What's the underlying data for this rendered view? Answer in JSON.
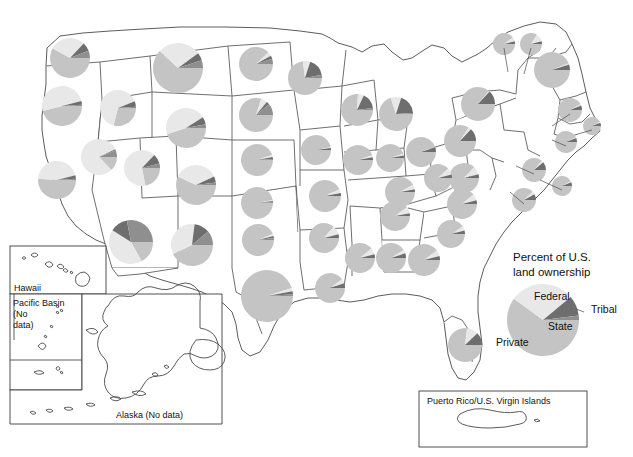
{
  "figure": {
    "title": "Percent of U.S. land ownership",
    "kind": "choropleth-pie-map"
  },
  "legend": {
    "title_line1": "Percent of U.S.",
    "title_line2": "land ownership",
    "center": {
      "x": 543,
      "y": 320
    },
    "radius": 36,
    "labels": {
      "federal": "Federal",
      "tribal": "Tribal",
      "state": "State",
      "private": "Private"
    }
  },
  "colors": {
    "private": "#c4c4c4",
    "federal": "#e8e8e8",
    "state": "#6e6e6e",
    "tribal": "#8f8f8f",
    "outline": "#4a4a4a",
    "background": "#ffffff",
    "text": "#111111"
  },
  "categories": [
    "private",
    "federal",
    "state",
    "tribal"
  ],
  "insets": [
    {
      "name": "hawaii",
      "label": "Hawaii",
      "no_data": false,
      "box": {
        "x": 10,
        "y": 246,
        "w": 96,
        "h": 48
      }
    },
    {
      "name": "pacific-basin",
      "label": "Pacific Basin (No data)",
      "no_data": true,
      "label_lines": [
        "Pacific Basin",
        "(No",
        "data)"
      ],
      "box": {
        "x": 10,
        "y": 294,
        "w": 72,
        "h": 96
      }
    },
    {
      "name": "alaska",
      "label": "Alaska (No data)",
      "no_data": true,
      "box": {
        "x": 10,
        "y": 294,
        "w": 212,
        "h": 130
      }
    },
    {
      "name": "puerto-rico",
      "label": "Puerto Rico/U.S. Virgin Islands",
      "no_data": false,
      "box": {
        "x": 419,
        "y": 391,
        "w": 168,
        "h": 56
      }
    }
  ],
  "chart_data": {
    "type": "pie",
    "title": "Percent of U.S. land ownership",
    "series_names": [
      "Private",
      "Federal",
      "State",
      "Tribal"
    ],
    "legend_position": "right",
    "national": {
      "private": 60,
      "federal": 29,
      "state": 9,
      "tribal": 2
    },
    "units": "percent",
    "states": [
      {
        "code": "WA",
        "name": "Washington",
        "cx": 70,
        "cy": 58,
        "r": 20,
        "private": 58,
        "federal": 29,
        "state": 7,
        "tribal": 6
      },
      {
        "code": "OR",
        "name": "Oregon",
        "cx": 62,
        "cy": 106,
        "r": 20,
        "private": 46,
        "federal": 50,
        "state": 3,
        "tribal": 1
      },
      {
        "code": "CA",
        "name": "California",
        "cx": 57,
        "cy": 180,
        "r": 19,
        "private": 51,
        "federal": 45,
        "state": 3,
        "tribal": 1
      },
      {
        "code": "ID",
        "name": "Idaho",
        "cx": 118,
        "cy": 108,
        "r": 18,
        "private": 29,
        "federal": 65,
        "state": 5,
        "tribal": 1
      },
      {
        "code": "NV",
        "name": "Nevada",
        "cx": 99,
        "cy": 157,
        "r": 18,
        "private": 13,
        "federal": 80,
        "state": 1,
        "tribal": 6
      },
      {
        "code": "MT",
        "name": "Montana",
        "cx": 178,
        "cy": 68,
        "r": 25,
        "private": 62,
        "federal": 28,
        "state": 5,
        "tribal": 5
      },
      {
        "code": "WY",
        "name": "Wyoming",
        "cx": 186,
        "cy": 128,
        "r": 20,
        "private": 45,
        "federal": 46,
        "state": 6,
        "tribal": 3
      },
      {
        "code": "UT",
        "name": "Utah",
        "cx": 142,
        "cy": 168,
        "r": 18,
        "private": 22,
        "federal": 65,
        "state": 9,
        "tribal": 4
      },
      {
        "code": "CO",
        "name": "Colorado",
        "cx": 196,
        "cy": 185,
        "r": 20,
        "private": 57,
        "federal": 36,
        "state": 5,
        "tribal": 2
      },
      {
        "code": "AZ",
        "name": "Arizona",
        "cx": 131,
        "cy": 242,
        "r": 22,
        "private": 17,
        "federal": 42,
        "state": 13,
        "tribal": 28
      },
      {
        "code": "NM",
        "name": "New Mexico",
        "cx": 192,
        "cy": 245,
        "r": 21,
        "private": 43,
        "federal": 34,
        "state": 12,
        "tribal": 11
      },
      {
        "code": "ND",
        "name": "North Dakota",
        "cx": 256,
        "cy": 64,
        "r": 17,
        "private": 88,
        "federal": 4,
        "state": 3,
        "tribal": 5
      },
      {
        "code": "SD",
        "name": "South Dakota",
        "cx": 256,
        "cy": 115,
        "r": 17,
        "private": 80,
        "federal": 6,
        "state": 3,
        "tribal": 11
      },
      {
        "code": "NE",
        "name": "Nebraska",
        "cx": 257,
        "cy": 160,
        "r": 16,
        "private": 95,
        "federal": 2,
        "state": 2,
        "tribal": 1
      },
      {
        "code": "KS",
        "name": "Kansas",
        "cx": 257,
        "cy": 203,
        "r": 16,
        "private": 97,
        "federal": 1,
        "state": 1,
        "tribal": 1
      },
      {
        "code": "OK",
        "name": "Oklahoma",
        "cx": 258,
        "cy": 240,
        "r": 16,
        "private": 94,
        "federal": 2,
        "state": 2,
        "tribal": 2
      },
      {
        "code": "TX",
        "name": "Texas",
        "cx": 267,
        "cy": 296,
        "r": 26,
        "private": 95,
        "federal": 2,
        "state": 2,
        "tribal": 1
      },
      {
        "code": "MN",
        "name": "Minnesota",
        "cx": 305,
        "cy": 78,
        "r": 17,
        "private": 73,
        "federal": 7,
        "state": 17,
        "tribal": 3
      },
      {
        "code": "IA",
        "name": "Iowa",
        "cx": 316,
        "cy": 150,
        "r": 15,
        "private": 97,
        "federal": 1,
        "state": 2,
        "tribal": 0
      },
      {
        "code": "MO",
        "name": "Missouri",
        "cx": 325,
        "cy": 196,
        "r": 16,
        "private": 93,
        "federal": 4,
        "state": 3,
        "tribal": 0
      },
      {
        "code": "AR",
        "name": "Arkansas",
        "cx": 324,
        "cy": 238,
        "r": 15,
        "private": 86,
        "federal": 10,
        "state": 4,
        "tribal": 0
      },
      {
        "code": "LA",
        "name": "Louisiana",
        "cx": 330,
        "cy": 288,
        "r": 15,
        "private": 90,
        "federal": 5,
        "state": 5,
        "tribal": 0
      },
      {
        "code": "WI",
        "name": "Wisconsin",
        "cx": 357,
        "cy": 110,
        "r": 16,
        "private": 76,
        "federal": 6,
        "state": 16,
        "tribal": 2
      },
      {
        "code": "IL",
        "name": "Illinois",
        "cx": 358,
        "cy": 160,
        "r": 15,
        "private": 95,
        "federal": 2,
        "state": 3,
        "tribal": 0
      },
      {
        "code": "MI",
        "name": "Michigan",
        "cx": 396,
        "cy": 114,
        "r": 17,
        "private": 70,
        "federal": 10,
        "state": 19,
        "tribal": 1
      },
      {
        "code": "IN",
        "name": "Indiana",
        "cx": 390,
        "cy": 158,
        "r": 14,
        "private": 95,
        "federal": 2,
        "state": 3,
        "tribal": 0
      },
      {
        "code": "OH",
        "name": "Ohio",
        "cx": 421,
        "cy": 152,
        "r": 15,
        "private": 94,
        "federal": 1,
        "state": 5,
        "tribal": 0
      },
      {
        "code": "KY",
        "name": "Kentucky",
        "cx": 400,
        "cy": 192,
        "r": 15,
        "private": 92,
        "federal": 5,
        "state": 3,
        "tribal": 0
      },
      {
        "code": "TN",
        "name": "Tennessee",
        "cx": 395,
        "cy": 216,
        "r": 15,
        "private": 90,
        "federal": 7,
        "state": 3,
        "tribal": 0
      },
      {
        "code": "MS",
        "name": "Mississippi",
        "cx": 360,
        "cy": 258,
        "r": 15,
        "private": 89,
        "federal": 7,
        "state": 4,
        "tribal": 0
      },
      {
        "code": "AL",
        "name": "Alabama",
        "cx": 391,
        "cy": 258,
        "r": 15,
        "private": 91,
        "federal": 4,
        "state": 5,
        "tribal": 0
      },
      {
        "code": "GA",
        "name": "Georgia",
        "cx": 424,
        "cy": 260,
        "r": 16,
        "private": 90,
        "federal": 6,
        "state": 4,
        "tribal": 0
      },
      {
        "code": "FL",
        "name": "Florida",
        "cx": 465,
        "cy": 345,
        "r": 17,
        "private": 77,
        "federal": 11,
        "state": 12,
        "tribal": 0
      },
      {
        "code": "SC",
        "name": "South Carolina",
        "cx": 451,
        "cy": 234,
        "r": 14,
        "private": 91,
        "federal": 5,
        "state": 4,
        "tribal": 0
      },
      {
        "code": "NC",
        "name": "North Carolina",
        "cx": 462,
        "cy": 204,
        "r": 15,
        "private": 89,
        "federal": 7,
        "state": 4,
        "tribal": 0
      },
      {
        "code": "VA",
        "name": "Virginia",
        "cx": 464,
        "cy": 178,
        "r": 15,
        "private": 87,
        "federal": 9,
        "state": 4,
        "tribal": 0
      },
      {
        "code": "WV",
        "name": "West Virginia",
        "cx": 438,
        "cy": 178,
        "r": 14,
        "private": 88,
        "federal": 8,
        "state": 4,
        "tribal": 0
      },
      {
        "code": "PA",
        "name": "Pennsylvania",
        "cx": 460,
        "cy": 141,
        "r": 16,
        "private": 84,
        "federal": 3,
        "state": 13,
        "tribal": 0
      },
      {
        "code": "NY",
        "name": "New York",
        "cx": 478,
        "cy": 104,
        "r": 17,
        "private": 86,
        "federal": 1,
        "state": 13,
        "tribal": 0
      },
      {
        "code": "ME",
        "name": "Maine",
        "cx": 552,
        "cy": 70,
        "r": 18,
        "private": 94,
        "federal": 1,
        "state": 5,
        "tribal": 0
      },
      {
        "code": "VT",
        "name": "Vermont",
        "cx": 504,
        "cy": 44,
        "r": 11,
        "private": 90,
        "federal": 6,
        "state": 4,
        "tribal": 0
      },
      {
        "code": "NH",
        "name": "New Hampshire",
        "cx": 531,
        "cy": 44,
        "r": 11,
        "private": 84,
        "federal": 12,
        "state": 4,
        "tribal": 0
      },
      {
        "code": "MA",
        "name": "Massachusetts",
        "cx": 570,
        "cy": 110,
        "r": 12,
        "private": 92,
        "federal": 2,
        "state": 6,
        "tribal": 0
      },
      {
        "code": "CT",
        "name": "Connecticut",
        "cx": 566,
        "cy": 142,
        "r": 11,
        "private": 93,
        "federal": 1,
        "state": 6,
        "tribal": 0
      },
      {
        "code": "RI",
        "name": "Rhode Island",
        "cx": 592,
        "cy": 126,
        "r": 9,
        "private": 92,
        "federal": 2,
        "state": 6,
        "tribal": 0
      },
      {
        "code": "NJ",
        "name": "New Jersey",
        "cx": 534,
        "cy": 170,
        "r": 12,
        "private": 86,
        "federal": 3,
        "state": 11,
        "tribal": 0
      },
      {
        "code": "DE",
        "name": "Delaware",
        "cx": 562,
        "cy": 186,
        "r": 10,
        "private": 92,
        "federal": 2,
        "state": 6,
        "tribal": 0
      },
      {
        "code": "MD",
        "name": "Maryland",
        "cx": 524,
        "cy": 200,
        "r": 12,
        "private": 88,
        "federal": 4,
        "state": 8,
        "tribal": 0
      },
      {
        "code": "HI",
        "name": "Hawaii",
        "cx": 44,
        "cy": 275,
        "r": 13,
        "private": 62,
        "federal": 16,
        "state": 20,
        "tribal": 2
      },
      {
        "code": "PR",
        "name": "Puerto Rico",
        "cx": 474,
        "cy": 424,
        "r": 13,
        "private": 83,
        "federal": 10,
        "state": 7,
        "tribal": 0
      }
    ]
  }
}
